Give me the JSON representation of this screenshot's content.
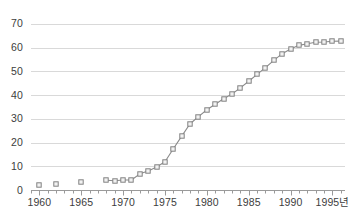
{
  "chart_data": {
    "type": "line",
    "title": "",
    "subtitle": "",
    "xlabel": "년",
    "ylabel": "",
    "xlim": [
      1959,
      1996.5
    ],
    "ylim": [
      0,
      72
    ],
    "grid": true,
    "legend": false,
    "marker": "open-square",
    "line_color": "#8a8a8a",
    "marker_edge_color": "#808080",
    "marker_face_color": "#f2f2f2",
    "grid_color": "#d9d9d9",
    "axis_color": "#9a9a9a",
    "text_color": "#3d3d3d",
    "y_ticks": [
      0,
      10,
      20,
      30,
      40,
      50,
      60,
      70
    ],
    "y_tick_labels": [
      "0",
      "10",
      "20",
      "30",
      "40",
      "50",
      "60",
      "70"
    ],
    "x_ticks": [
      1960,
      1965,
      1970,
      1975,
      1980,
      1985,
      1990,
      1995
    ],
    "x_tick_labels": [
      "1960",
      "1965",
      "1970",
      "1975",
      "1980",
      "1985",
      "1990",
      "1995년"
    ],
    "x_minor_tick_step": 1,
    "series": [
      {
        "name": "early-isolated-points",
        "connected": false,
        "x": [
          1960,
          1962,
          1965
        ],
        "values": [
          2.0,
          2.5,
          3.2
        ]
      },
      {
        "name": "main-curve",
        "connected": true,
        "x": [
          1968,
          1969,
          1970,
          1971,
          1972,
          1973,
          1974,
          1975,
          1976,
          1977,
          1978,
          1979,
          1980,
          1981,
          1982,
          1983,
          1984,
          1985,
          1986,
          1987,
          1988,
          1989,
          1990,
          1991,
          1992,
          1993,
          1994,
          1995,
          1996
        ],
        "values": [
          4.1,
          3.9,
          4.2,
          4.2,
          6.8,
          8.0,
          9.7,
          11.9,
          17.4,
          22.7,
          27.9,
          30.9,
          33.8,
          36.1,
          38.4,
          40.4,
          43.0,
          45.8,
          48.7,
          51.5,
          54.6,
          57.4,
          59.4,
          60.9,
          61.6,
          62.2,
          62.3,
          62.6,
          62.7
        ]
      }
    ]
  }
}
